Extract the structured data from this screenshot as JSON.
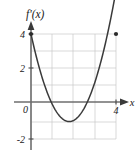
{
  "figure": {
    "title_label": "f'(x)",
    "x_axis_label": "x",
    "background_color": "#ffffff",
    "curve_color": "#3a3a3a",
    "grid_color": "#c8c8c8",
    "axis_color": "#6e6e6e",
    "text_color": "#1a1a1a"
  },
  "chart_data": {
    "type": "line",
    "title": "f'(x)",
    "xlabel": "x",
    "ylabel": "f'(x)",
    "xlim": [
      -0.55,
      4.85
    ],
    "ylim": [
      -2.55,
      4.75
    ],
    "grid": true,
    "legend": "none",
    "x_ticks": [
      4
    ],
    "x_tick_labels": [
      "4"
    ],
    "y_ticks": [
      4,
      2,
      0,
      -2
    ],
    "y_tick_labels": [
      "4",
      "2",
      "0",
      "-2"
    ],
    "x_gridlines": [
      0,
      1,
      2,
      3,
      4
    ],
    "y_gridlines": [
      -2,
      -1,
      0,
      1,
      2,
      3,
      4
    ],
    "series": [
      {
        "name": "f'(x)",
        "kind": "parabola",
        "equation": "y = 1.28(x - 1.8)^2 - 1.15",
        "x": [
          0.0,
          0.2,
          0.4,
          0.6,
          0.8,
          1.0,
          1.2,
          1.4,
          1.6,
          1.8,
          2.0,
          2.2,
          2.4,
          2.6,
          2.8,
          3.0,
          3.2,
          3.4,
          3.6,
          3.8,
          4.0
        ],
        "y": [
          4.0,
          3.13,
          2.36,
          1.69,
          1.13,
          0.67,
          0.31,
          0.05,
          -0.1,
          -1.15,
          -1.1,
          -0.95,
          -0.69,
          -0.33,
          0.13,
          0.69,
          1.36,
          2.12,
          3.0,
          3.46,
          4.0
        ]
      }
    ],
    "markers": [
      {
        "name": "left-endpoint",
        "x": 0,
        "y": 4,
        "style": "filled-dot"
      },
      {
        "name": "right-endpoint",
        "x": 4,
        "y": 4,
        "style": "filled-dot"
      }
    ],
    "vertex": {
      "x": 1.8,
      "y": -1.15
    },
    "roots": [
      0.85,
      2.75
    ]
  }
}
